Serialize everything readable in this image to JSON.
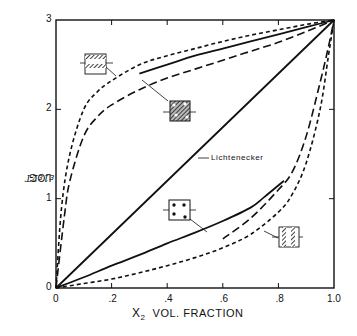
{
  "chart_data": {
    "type": "line",
    "title": "",
    "xlabel": "X2 VOL. FRACTION",
    "xlabel_parts": {
      "var": "X",
      "sub": "2",
      "text": "VOL. FRACTION"
    },
    "ylabel": "LOG ε1ε2T",
    "xlim": [
      0,
      1.0
    ],
    "ylim": [
      0,
      3
    ],
    "x_ticks": [
      0,
      0.2,
      0.4,
      0.6,
      0.8,
      1.0
    ],
    "x_tick_labels": [
      "0",
      ".2",
      ".4",
      ".6",
      ".8",
      "1.0"
    ],
    "y_ticks": [
      0,
      1,
      2,
      3
    ],
    "y_tick_labels": [
      "0",
      "1",
      "2",
      "3"
    ],
    "grid": false,
    "legend": "none (insets identify curves)",
    "series": [
      {
        "name": "parallel layers (upper bound)",
        "style": "short-dash",
        "x": [
          0,
          0.02,
          0.05,
          0.1,
          0.15,
          0.2,
          0.3,
          0.4,
          0.5,
          0.6,
          0.7,
          0.8,
          0.9,
          1.0
        ],
        "y": [
          0,
          0.9,
          1.5,
          2.0,
          2.2,
          2.32,
          2.5,
          2.6,
          2.68,
          2.76,
          2.83,
          2.89,
          2.95,
          3.0
        ]
      },
      {
        "name": "upper model (long-dash)",
        "style": "long-dash",
        "x": [
          0,
          0.03,
          0.05,
          0.1,
          0.15,
          0.2,
          0.3,
          0.4,
          0.5,
          0.6,
          0.7,
          0.8,
          0.9,
          1.0
        ],
        "y": [
          0,
          0.8,
          1.2,
          1.7,
          1.92,
          2.05,
          2.22,
          2.35,
          2.45,
          2.55,
          2.65,
          2.75,
          2.87,
          3.0
        ]
      },
      {
        "name": "dispersed low-ε particles in high-ε matrix",
        "style": "solid",
        "x": [
          0.3,
          0.4,
          0.5,
          0.6,
          0.7,
          0.8,
          0.9,
          1.0
        ],
        "y": [
          2.4,
          2.5,
          2.6,
          2.68,
          2.76,
          2.84,
          2.92,
          3.0
        ]
      },
      {
        "name": "Lichtenecker",
        "style": "solid",
        "x": [
          0,
          1.0
        ],
        "y": [
          0,
          3.0
        ]
      },
      {
        "name": "dispersed high-ε particles in low-ε matrix",
        "style": "solid",
        "x": [
          0,
          0.1,
          0.2,
          0.3,
          0.4,
          0.5,
          0.6,
          0.7,
          0.75,
          0.82
        ],
        "y": [
          0,
          0.12,
          0.25,
          0.37,
          0.5,
          0.62,
          0.75,
          0.9,
          1.02,
          1.2
        ]
      },
      {
        "name": "lower model (long-dash)",
        "style": "long-dash",
        "x": [
          0.6,
          0.7,
          0.8,
          0.85,
          0.9,
          0.95,
          0.98,
          1.0
        ],
        "y": [
          0.55,
          0.78,
          1.1,
          1.3,
          1.7,
          2.3,
          2.7,
          3.0
        ]
      },
      {
        "name": "series layers (lower bound)",
        "style": "short-dash",
        "x": [
          0,
          0.1,
          0.2,
          0.3,
          0.4,
          0.5,
          0.6,
          0.7,
          0.8,
          0.85,
          0.9,
          0.95,
          0.98,
          1.0
        ],
        "y": [
          0,
          0.05,
          0.1,
          0.17,
          0.25,
          0.34,
          0.45,
          0.6,
          0.85,
          1.05,
          1.4,
          2.0,
          2.6,
          3.0
        ]
      }
    ],
    "annotations": [
      {
        "text": "Lichtenecker",
        "x": 0.46,
        "y": 1.45
      },
      {
        "inset": "parallel-layers-icon",
        "x": 0.14,
        "y": 2.55
      },
      {
        "inset": "dispersed-particles-dark-matrix-icon",
        "x": 0.44,
        "y": 2.0
      },
      {
        "inset": "dispersed-particles-light-matrix-icon",
        "x": 0.44,
        "y": 0.85
      },
      {
        "inset": "series-layers-icon",
        "x": 0.83,
        "y": 0.45
      }
    ]
  },
  "labels": {
    "y_axis": "LOG",
    "y_axis_symbol": "ε1ε2T",
    "x_var": "X",
    "x_sub": "2",
    "x_text": "VOL. FRACTION",
    "lichtenecker": "Lichtenecker",
    "ticks_x": [
      "0",
      ".2",
      ".4",
      ".6",
      ".8",
      "1.0"
    ],
    "ticks_y": [
      "0",
      "1",
      "2",
      "3"
    ]
  },
  "colors": {
    "ink": "#111111",
    "background": "#ffffff"
  }
}
